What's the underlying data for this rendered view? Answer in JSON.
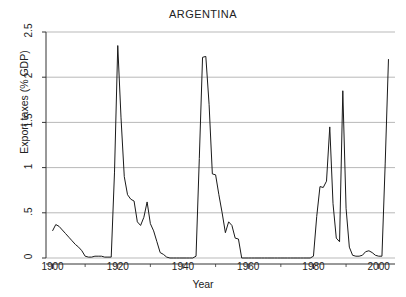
{
  "chart_data": {
    "type": "line",
    "title": "ARGENTINA",
    "xlabel": "Year",
    "ylabel": "Export taxes (% GDP)",
    "xlim": [
      1898,
      2005
    ],
    "ylim": [
      0,
      2.5
    ],
    "grid": true,
    "legend": null,
    "xticks": [
      1900,
      1920,
      1940,
      1960,
      1980,
      2000
    ],
    "xtick_labels": [
      "1900",
      "1920",
      "1940",
      "1960",
      "1980",
      "2000"
    ],
    "yticks": [
      0,
      0.5,
      1,
      1.5,
      2,
      2.5
    ],
    "ytick_labels": [
      "0",
      ".5",
      "1",
      "1.5",
      "2",
      "2.5"
    ],
    "line_color": "#1a1a1a",
    "grid_color": "#9b9b9b",
    "series": [
      {
        "name": "Export taxes (% GDP)",
        "x": [
          1900,
          1901,
          1902,
          1903,
          1904,
          1905,
          1906,
          1907,
          1908,
          1909,
          1910,
          1911,
          1912,
          1913,
          1914,
          1915,
          1916,
          1917,
          1918,
          1919,
          1920,
          1921,
          1922,
          1923,
          1924,
          1925,
          1926,
          1927,
          1928,
          1929,
          1930,
          1931,
          1932,
          1933,
          1934,
          1935,
          1936,
          1937,
          1938,
          1939,
          1940,
          1941,
          1942,
          1943,
          1944,
          1945,
          1946,
          1947,
          1948,
          1949,
          1950,
          1951,
          1952,
          1953,
          1954,
          1955,
          1956,
          1957,
          1958,
          1959,
          1960,
          1961,
          1962,
          1963,
          1964,
          1965,
          1966,
          1967,
          1968,
          1969,
          1970,
          1971,
          1972,
          1973,
          1974,
          1975,
          1976,
          1977,
          1978,
          1979,
          1980,
          1981,
          1982,
          1983,
          1984,
          1985,
          1986,
          1987,
          1988,
          1989,
          1990,
          1991,
          1992,
          1993,
          1994,
          1995,
          1996,
          1997,
          1998,
          1999,
          2000,
          2001,
          2002,
          2003
        ],
        "y": [
          0.3,
          0.37,
          0.35,
          0.31,
          0.27,
          0.23,
          0.19,
          0.15,
          0.12,
          0.08,
          0.02,
          0.01,
          0.01,
          0.02,
          0.02,
          0.02,
          0.01,
          0.01,
          0.01,
          0.95,
          2.35,
          1.55,
          0.9,
          0.7,
          0.65,
          0.63,
          0.4,
          0.36,
          0.45,
          0.62,
          0.38,
          0.3,
          0.18,
          0.06,
          0.04,
          0.01,
          0.0,
          0.0,
          0.0,
          0.0,
          0.0,
          0.0,
          0.0,
          0.0,
          0.02,
          1.1,
          2.22,
          2.23,
          1.7,
          0.93,
          0.92,
          0.7,
          0.5,
          0.28,
          0.4,
          0.36,
          0.22,
          0.21,
          0.0,
          0.0,
          0.0,
          0.0,
          0.0,
          0.0,
          0.0,
          0.0,
          0.0,
          0.0,
          0.0,
          0.0,
          0.0,
          0.0,
          0.0,
          0.0,
          0.0,
          0.0,
          0.0,
          0.0,
          0.0,
          0.0,
          0.02,
          0.46,
          0.79,
          0.78,
          0.85,
          1.45,
          0.6,
          0.22,
          0.18,
          1.85,
          0.55,
          0.12,
          0.03,
          0.02,
          0.02,
          0.03,
          0.07,
          0.08,
          0.06,
          0.03,
          0.02,
          0.02,
          1.05,
          2.2
        ]
      }
    ]
  }
}
